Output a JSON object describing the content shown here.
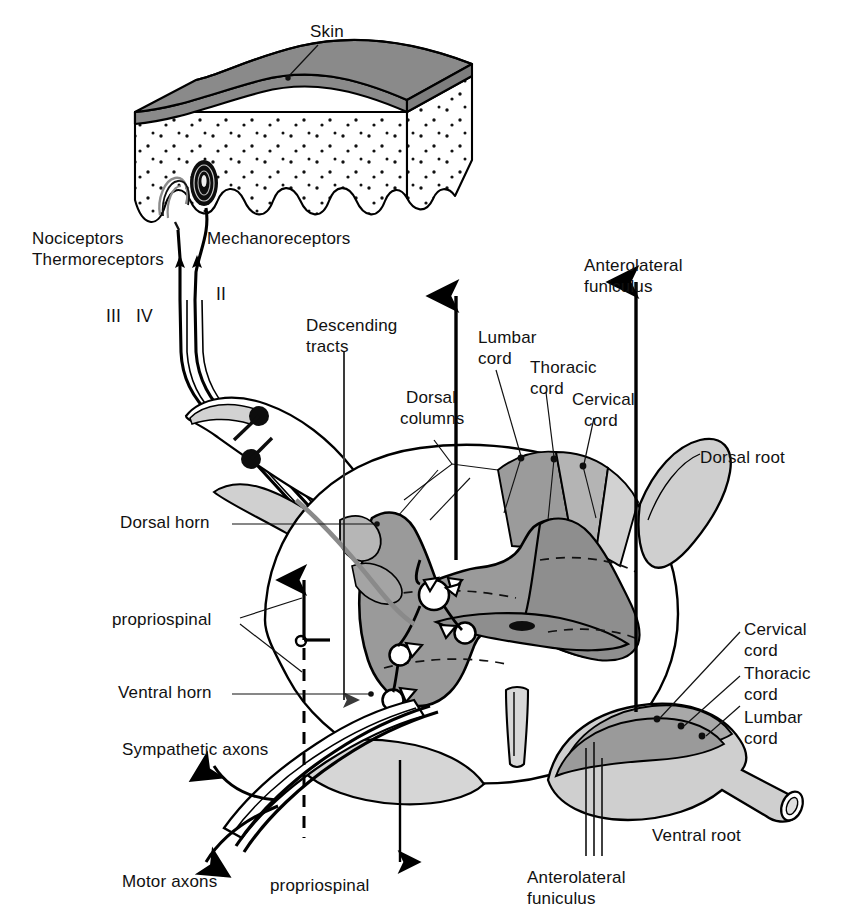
{
  "figure": {
    "domain": "anatomical-diagram"
  },
  "colors": {
    "epidermis_gray": "#8a8a8a",
    "gray_matter": "#9a9a9a",
    "fan_lumbar": "#9b9b9b",
    "fan_thoracic": "#b4b4b4",
    "fan_cervical": "#d2d2d2",
    "root_light": "#cfcfcf",
    "root_mid": "#a8a8a8",
    "white_matter": "#ffffff",
    "stroke": "#000000",
    "leader_line": "#1a1a1a"
  },
  "labels": {
    "skin": "Skin",
    "nociceptors": "Nociceptors",
    "thermoreceptors": "Thermoreceptors",
    "mechanoreceptors": "Mechanoreceptors",
    "fiber_class_iii": "III",
    "fiber_class_iv": "IV",
    "fiber_class_ii": "II",
    "descending_tracts_line1": "Descending",
    "descending_tracts_line2": "tracts",
    "dorsal_columns_line1": "Dorsal",
    "dorsal_columns_line2": "columns",
    "anterolateral_funiculus_top_line1": "Anterolateral",
    "anterolateral_funiculus_top_line2": "funiculus",
    "anterolateral_funiculus_bottom_line1": "Anterolateral",
    "anterolateral_funiculus_bottom_line2": "funiculus",
    "lumbar_cord_top_line1": "Lumbar",
    "lumbar_cord_top_line2": "cord",
    "thoracic_cord_top_line1": "Thoracic",
    "thoracic_cord_top_line2": "cord",
    "cervical_cord_top_line1": "Cervical",
    "cervical_cord_top_line2": "cord",
    "cervical_cord_right_line1": "Cervical",
    "cervical_cord_right_line2": "cord",
    "thoracic_cord_right_line1": "Thoracic",
    "thoracic_cord_right_line2": "cord",
    "lumbar_cord_right_line1": "Lumbar",
    "lumbar_cord_right_line2": "cord",
    "dorsal_root": "Dorsal root",
    "ventral_root": "Ventral root",
    "dorsal_horn": "Dorsal horn",
    "ventral_horn": "Ventral horn",
    "propriospinal_left": "propriospinal",
    "propriospinal_bottom": "propriospinal",
    "sympathetic_axons": "Sympathetic axons",
    "motor_axons": "Motor axons"
  },
  "structures": {
    "skin_block": "epidermis slab over stippled dermis with wavy dermal papillae",
    "receptors": [
      "free nerve ending",
      "lamellated mechanoreceptor corpuscle"
    ],
    "dorsal_root_ganglion_cells": 2,
    "dorsal_column_fan_segments": [
      "lumbar",
      "thoracic",
      "cervical"
    ],
    "root_lamination_segments": [
      "cervical",
      "thoracic",
      "lumbar"
    ],
    "interneuron_somata": 5,
    "synaptic_boutons": 6,
    "central_canal": "midline oval"
  }
}
